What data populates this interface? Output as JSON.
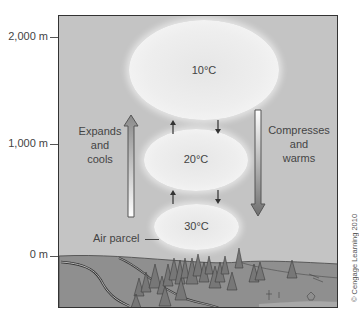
{
  "figure": {
    "y_axis": {
      "ticks": [
        {
          "label": "2,000 m",
          "value": 2000
        },
        {
          "label": "1,000 m",
          "value": 1000
        },
        {
          "label": "0 m",
          "value": 0
        }
      ]
    },
    "parcels": [
      {
        "label": "10°C",
        "altitude_m": 2000
      },
      {
        "label": "20°C",
        "altitude_m": 1000
      },
      {
        "label": "30°C",
        "altitude_m": 0
      }
    ],
    "left_process": {
      "line1": "Expands",
      "line2": "and",
      "line3": "cools",
      "direction": "up"
    },
    "right_process": {
      "line1": "Compresses",
      "line2": "and",
      "line3": "warms",
      "direction": "down"
    },
    "callout": "Air parcel",
    "credit": "© Cengage Learning 2010",
    "colors": {
      "sky": "#c4c4c4",
      "parcel": "#eeeeee",
      "ground": "#8e8e8e",
      "tree": "#7a7a7a",
      "frame": "#333333"
    }
  }
}
